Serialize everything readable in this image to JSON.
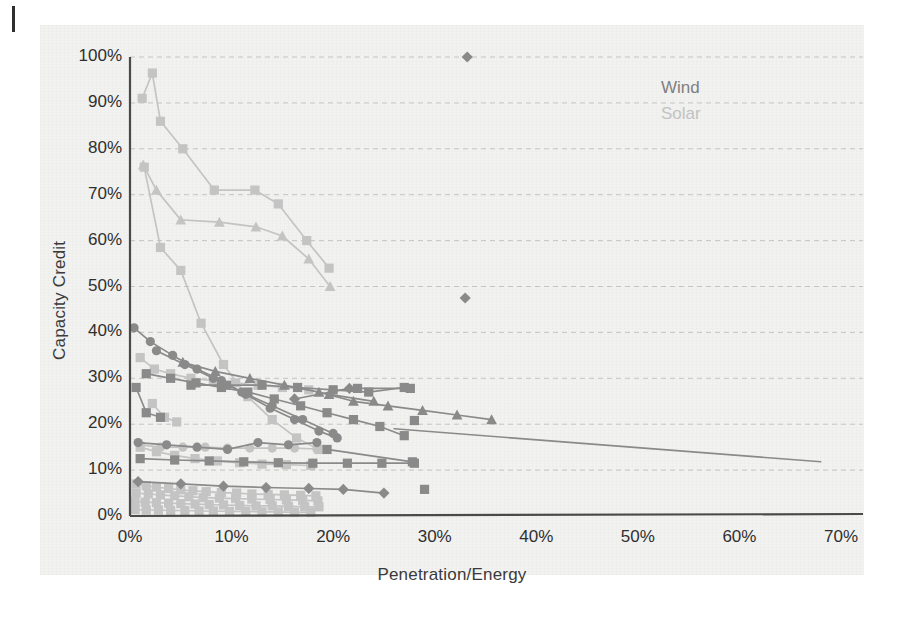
{
  "figure": {
    "title": "",
    "legend": {
      "position": "top-right",
      "entries": [
        {
          "label": "Wind",
          "color": "#7f7f7f"
        },
        {
          "label": "Solar",
          "color": "#c2c2c2"
        }
      ]
    }
  },
  "chart_data": {
    "type": "scatter",
    "title": "",
    "subtitle": "",
    "xlabel": "Penetration/Energy",
    "ylabel": "Capacity Credit",
    "xlim": [
      0,
      70
    ],
    "ylim": [
      0,
      100
    ],
    "xticks": [
      "0%",
      "10%",
      "20%",
      "30%",
      "40%",
      "50%",
      "60%",
      "70%"
    ],
    "xtick_values": [
      0,
      10,
      20,
      30,
      40,
      50,
      60,
      70
    ],
    "yticks": [
      "0%",
      "10%",
      "20%",
      "30%",
      "40%",
      "50%",
      "60%",
      "70%",
      "80%",
      "90%",
      "100%"
    ],
    "ytick_values": [
      0,
      10,
      20,
      30,
      40,
      50,
      60,
      70,
      80,
      90,
      100
    ],
    "grid": "horizontal-dashed",
    "units": "percent",
    "legend_position": "top-right",
    "annotations": [],
    "colors": {
      "wind": "#7f7f7f",
      "solar": "#c4c4c4",
      "axis": "#4a4a4a",
      "grid": "#bdbdbd",
      "text": "#2f2f2f"
    },
    "series": [
      {
        "name": "Solar S1",
        "group": "Solar",
        "color": "#c4c4c4",
        "marker": "square",
        "x": [
          1.2,
          2.2,
          3.0,
          5.2,
          8.3,
          12.3,
          14.6,
          17.4,
          19.6
        ],
        "y": [
          91.0,
          96.5,
          86.0,
          80.0,
          71.0,
          71.0,
          68.0,
          60.0,
          54.0
        ]
      },
      {
        "name": "Solar S2",
        "group": "Solar",
        "color": "#c4c4c4",
        "marker": "triangle",
        "x": [
          1.3,
          2.6,
          5.0,
          8.8,
          12.4,
          15.0,
          17.6,
          19.7
        ],
        "y": [
          76.5,
          71.0,
          64.5,
          64.0,
          63.0,
          61.0,
          56.0,
          50.0
        ]
      },
      {
        "name": "Solar S3",
        "group": "Solar",
        "color": "#c4c4c4",
        "marker": "square",
        "x": [
          1.4,
          3.0,
          5.0,
          7.0,
          9.2,
          11.6,
          14.0,
          16.4,
          18.6
        ],
        "y": [
          76.0,
          58.5,
          53.5,
          42.0,
          33.0,
          26.0,
          21.0,
          17.0,
          14.5
        ]
      },
      {
        "name": "Solar S4",
        "group": "Solar",
        "color": "#c4c4c4",
        "marker": "square",
        "x": [
          1.0,
          2.4,
          4.0,
          6.0,
          8.2,
          10.4,
          12.6,
          15.0,
          17.6
        ],
        "y": [
          34.5,
          32.0,
          31.0,
          30.0,
          29.5,
          29.0,
          28.5,
          28.0,
          27.5
        ]
      },
      {
        "name": "Solar S5",
        "group": "Solar",
        "color": "#c4c4c4",
        "marker": "circle",
        "x": [
          1.0,
          3.0,
          5.2,
          7.4,
          9.6,
          11.8,
          14.0,
          16.2,
          18.4
        ],
        "y": [
          15.5,
          15.0,
          15.0,
          15.0,
          14.8,
          14.8,
          14.8,
          14.8,
          14.6
        ]
      },
      {
        "name": "Solar S6",
        "group": "Solar",
        "color": "#c4c4c4",
        "marker": "square",
        "x": [
          1.0,
          2.6,
          4.4,
          6.4,
          8.6,
          10.8,
          13.0,
          15.4,
          17.8
        ],
        "y": [
          15.0,
          14.0,
          13.2,
          12.5,
          12.0,
          11.6,
          11.3,
          11.2,
          11.0
        ]
      },
      {
        "name": "Solar S7",
        "group": "Solar",
        "color": "#c4c4c4",
        "marker": "square",
        "x": [
          0.6,
          1.6,
          2.6,
          3.8,
          5.0,
          6.2,
          7.5,
          9.0,
          10.5,
          12.0,
          13.6,
          15.2,
          16.8,
          18.3
        ],
        "y": [
          7.0,
          6.6,
          6.3,
          6.0,
          5.7,
          5.5,
          5.3,
          5.1,
          5.0,
          4.8,
          4.7,
          4.6,
          4.5,
          4.4
        ]
      },
      {
        "name": "Solar S8",
        "group": "Solar",
        "color": "#c4c4c4",
        "marker": "square",
        "x": [
          0.6,
          1.8,
          3.0,
          4.4,
          5.8,
          7.2,
          8.8,
          10.4,
          12.0,
          13.8,
          15.4,
          17.0,
          18.5
        ],
        "y": [
          5.0,
          4.8,
          4.6,
          4.4,
          4.2,
          4.0,
          3.9,
          3.8,
          3.7,
          3.6,
          3.5,
          3.4,
          3.3
        ]
      },
      {
        "name": "Solar S9",
        "group": "Solar",
        "color": "#c4c4c4",
        "marker": "square",
        "x": [
          0.5,
          1.5,
          2.6,
          3.8,
          5.0,
          6.4,
          7.8,
          9.2,
          10.8,
          12.4,
          14.0,
          15.6,
          17.2,
          18.6
        ],
        "y": [
          3.2,
          3.0,
          2.9,
          2.8,
          2.7,
          2.6,
          2.5,
          2.4,
          2.3,
          2.2,
          2.2,
          2.1,
          2.0,
          2.0
        ]
      },
      {
        "name": "Solar S10",
        "group": "Solar",
        "color": "#c4c4c4",
        "marker": "square",
        "x": [
          0.5,
          1.6,
          2.8,
          4.0,
          5.4,
          6.8,
          8.2,
          9.8,
          11.4,
          13.0,
          14.6,
          16.2,
          17.8
        ],
        "y": [
          1.4,
          1.3,
          1.3,
          1.2,
          1.2,
          1.1,
          1.1,
          1.0,
          1.0,
          0.9,
          0.9,
          0.8,
          0.8
        ]
      },
      {
        "name": "Solar S11",
        "group": "Solar",
        "color": "#c4c4c4",
        "marker": "square",
        "x": [
          2.2,
          3.4,
          4.6
        ],
        "y": [
          24.5,
          21.5,
          20.5
        ]
      },
      {
        "name": "Wind W1",
        "group": "Wind",
        "color": "#8a8a8a",
        "marker": "circle",
        "x": [
          0.4,
          2.0,
          4.2,
          6.6,
          9.0,
          11.4,
          13.8,
          16.2,
          18.6,
          20.4
        ],
        "y": [
          41.0,
          38.0,
          35.0,
          32.0,
          29.5,
          26.5,
          23.5,
          21.0,
          18.5,
          17.0
        ]
      },
      {
        "name": "Wind W2",
        "group": "Wind",
        "color": "#8a8a8a",
        "marker": "square",
        "x": [
          1.6,
          4.0,
          6.5,
          9.0,
          11.6,
          14.2,
          16.8,
          19.4,
          22.0,
          24.6,
          27.0
        ],
        "y": [
          31.0,
          30.0,
          29.0,
          28.0,
          27.0,
          25.5,
          24.0,
          22.5,
          21.0,
          19.5,
          17.5
        ]
      },
      {
        "name": "Wind W3",
        "group": "Wind",
        "color": "#8a8a8a",
        "marker": "triangle",
        "x": [
          5.2,
          8.4,
          11.8,
          15.2,
          18.6,
          22.0,
          25.4,
          28.8,
          32.2,
          35.6
        ],
        "y": [
          33.5,
          31.5,
          30.0,
          28.5,
          27.0,
          25.0,
          24.0,
          23.0,
          22.0,
          21.0
        ]
      },
      {
        "name": "Wind W4",
        "group": "Wind",
        "color": "#8a8a8a",
        "marker": "square",
        "x": [
          6.0,
          9.5,
          13.0,
          16.5,
          20.0,
          23.5,
          27.0
        ],
        "y": [
          28.5,
          28.5,
          28.5,
          28.0,
          27.5,
          27.0,
          28.0
        ]
      },
      {
        "name": "Wind W5",
        "group": "Wind",
        "color": "#8a8a8a",
        "marker": "circle",
        "x": [
          2.6,
          5.4,
          8.2,
          11.0,
          14.0,
          17.0,
          20.0
        ],
        "y": [
          36.0,
          33.0,
          30.0,
          27.0,
          24.0,
          21.0,
          18.0
        ]
      },
      {
        "name": "Wind W6",
        "group": "Wind",
        "color": "#8a8a8a",
        "marker": "square",
        "x": [
          0.6,
          1.6,
          3.0
        ],
        "y": [
          28.0,
          22.5,
          21.5
        ]
      },
      {
        "name": "Wind W7",
        "group": "Wind",
        "color": "#8a8a8a",
        "marker": "circle",
        "x": [
          0.8,
          3.6,
          6.6,
          9.6,
          12.6,
          15.6,
          18.4
        ],
        "y": [
          16.0,
          15.5,
          15.0,
          14.5,
          16.0,
          15.5,
          16.0
        ]
      },
      {
        "name": "Wind W8",
        "group": "Wind",
        "color": "#8a8a8a",
        "marker": "square",
        "x": [
          1.0,
          4.4,
          7.8,
          11.2,
          14.6,
          18.0,
          21.4,
          24.8,
          28.0
        ],
        "y": [
          12.5,
          12.2,
          12.0,
          11.8,
          11.6,
          11.5,
          11.5,
          11.5,
          11.5
        ]
      },
      {
        "name": "Wind W9",
        "group": "Wind",
        "color": "#8a8a8a",
        "marker": "diamond",
        "x": [
          0.8,
          5.0,
          9.2,
          13.4,
          17.6,
          21.0,
          25.0
        ],
        "y": [
          7.5,
          7.0,
          6.5,
          6.2,
          6.0,
          5.8,
          5.0
        ]
      },
      {
        "name": "Wind W10",
        "group": "Wind",
        "color": "#8a8a8a",
        "marker": "line-only",
        "x": [
          26.0,
          68.0
        ],
        "y": [
          19.0,
          11.8
        ]
      },
      {
        "name": "Wind W11",
        "group": "Wind",
        "color": "#8a8a8a",
        "marker": "diamond",
        "x": [
          16.2,
          21.6
        ],
        "y": [
          25.5,
          27.8
        ]
      },
      {
        "name": "Wind W12",
        "group": "Wind",
        "color": "#8a8a8a",
        "marker": "square",
        "x": [
          19.4,
          27.8
        ],
        "y": [
          14.5,
          11.8
        ]
      },
      {
        "name": "Wind W13",
        "group": "Wind",
        "color": "#8a8a8a",
        "marker": "square",
        "x": [
          28.0
        ],
        "y": [
          20.8
        ]
      },
      {
        "name": "Wind W14",
        "group": "Wind",
        "color": "#8a8a8a",
        "marker": "square",
        "x": [
          29.0
        ],
        "y": [
          5.8
        ]
      },
      {
        "name": "Wind W15",
        "group": "Wind",
        "color": "#8a8a8a",
        "marker": "diamond",
        "x": [
          33.2
        ],
        "y": [
          100.0
        ]
      },
      {
        "name": "Wind W16",
        "group": "Wind",
        "color": "#8a8a8a",
        "marker": "diamond",
        "x": [
          33.0
        ],
        "y": [
          47.5
        ]
      },
      {
        "name": "Wind W17",
        "group": "Wind",
        "color": "#8a8a8a",
        "marker": "triangle",
        "x": [
          19.6,
          24.0
        ],
        "y": [
          26.5,
          25.0
        ]
      },
      {
        "name": "Wind W18",
        "group": "Wind",
        "color": "#8a8a8a",
        "marker": "square",
        "x": [
          22.4,
          27.6
        ],
        "y": [
          27.8,
          27.8
        ]
      }
    ]
  }
}
